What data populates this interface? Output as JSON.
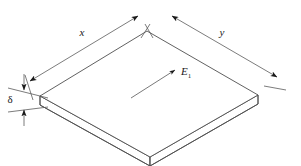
{
  "figure": {
    "name": "isometric-plate-diagram",
    "background_color": "#ffffff",
    "line_color": "#4f4f4f",
    "dimension_color": "#5a5a5a",
    "arrow_color": "#1a1a1a",
    "text_color": "#1a1a1a"
  },
  "labels": {
    "length_x": "x",
    "length_y": "y",
    "thickness": "δ",
    "field_vector": "E",
    "field_vector_subscript": "1"
  },
  "dimensions": {
    "x_dimension_name": "x-dimension",
    "y_dimension_name": "y-dimension",
    "thickness_dimension_name": "delta-thickness-dimension"
  },
  "geometry": {
    "top_face_vertices": "left(40,96) top(147,31) right(258,95) bottom(150,157)",
    "plate_thickness_px": 9
  }
}
